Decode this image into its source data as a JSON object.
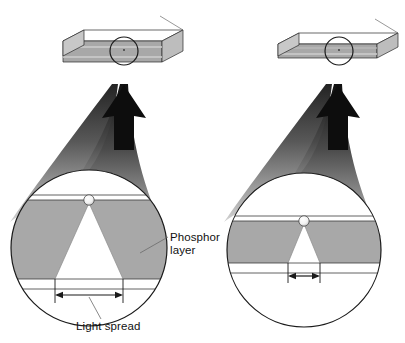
{
  "diagram": {
    "type": "technical-illustration",
    "background_color": "#ffffff",
    "line_color": "#1a1a1a",
    "phosphor_fill": "#a8a8a8",
    "plate_fill": "#a8a8a8",
    "beam_dark": "#121212",
    "beam_light": "#c9c9c9",
    "labels": {
      "phosphor_line1": "Phosphor",
      "phosphor_line2": "layer",
      "light_spread": "Light spread"
    },
    "panels": [
      {
        "id": "left",
        "name": "thick-phosphor-layer",
        "plate_thickness": "thick",
        "phosphor_thickness": "thick",
        "light_spread": "wide"
      },
      {
        "id": "right",
        "name": "thin-phosphor-layer",
        "plate_thickness": "thin",
        "phosphor_thickness": "thin",
        "light_spread": "narrow"
      }
    ]
  }
}
